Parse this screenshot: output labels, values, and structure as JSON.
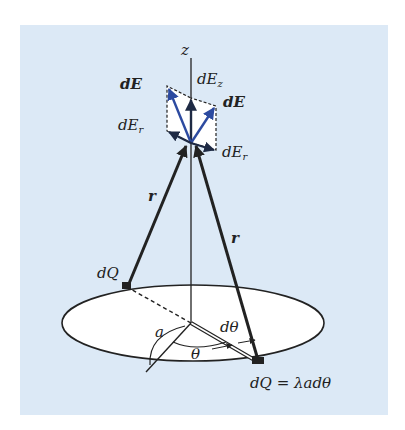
{
  "figure": {
    "panel_color": "#dce9f6",
    "disk_color": "#ffffff",
    "vector_color": "#2c4aa0",
    "line_color": "#222222",
    "axis": {
      "label": "z"
    },
    "labels": {
      "dE_left": "dE",
      "dEr_left_d": "dE",
      "dEr_left_sub": "r",
      "dEz_d": "dE",
      "dEz_sub": "z",
      "dE_right": "dE",
      "dEr_right_d": "dE",
      "dEr_right_sub": "r",
      "r_left": "r",
      "r_right": "r",
      "dQ_left": "dQ",
      "a": "a",
      "dtheta": "dθ",
      "theta": "θ",
      "dQ_right": "dQ = λadθ"
    }
  }
}
